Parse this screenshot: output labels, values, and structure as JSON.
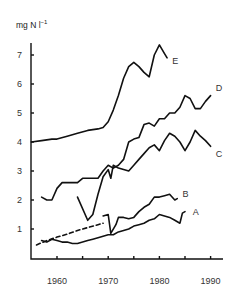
{
  "chart_data": {
    "type": "line",
    "title": "",
    "xlabel": "",
    "ylabel": "mg N l-1",
    "ylabel_unit": {
      "base": "mg N l",
      "superscript": "-1"
    },
    "xlim": [
      1955,
      1992
    ],
    "ylim": [
      0,
      7.5
    ],
    "x_ticks": [
      1960,
      1970,
      1980,
      1990
    ],
    "x_minor_ticks": [
      1965,
      1975,
      1985
    ],
    "y_ticks": [
      1,
      2,
      3,
      4,
      5,
      6,
      7
    ],
    "grid": false,
    "legend": "inline labels at line ends",
    "series": [
      {
        "name": "E",
        "style": "solid",
        "points": [
          [
            1955,
            4.0
          ],
          [
            1957,
            4.05
          ],
          [
            1959,
            4.1
          ],
          [
            1960,
            4.1
          ],
          [
            1962,
            4.2
          ],
          [
            1964,
            4.3
          ],
          [
            1966,
            4.4
          ],
          [
            1968,
            4.45
          ],
          [
            1969,
            4.5
          ],
          [
            1970,
            4.7
          ],
          [
            1971,
            5.1
          ],
          [
            1972,
            5.6
          ],
          [
            1973,
            6.2
          ],
          [
            1974,
            6.6
          ],
          [
            1975,
            6.75
          ],
          [
            1976,
            6.6
          ],
          [
            1977,
            6.4
          ],
          [
            1978,
            6.25
          ],
          [
            1979,
            7.0
          ],
          [
            1980,
            7.35
          ],
          [
            1981,
            7.05
          ],
          [
            1981.5,
            6.9
          ]
        ]
      },
      {
        "name": "D",
        "style": "solid",
        "points": [
          [
            1957,
            2.1
          ],
          [
            1958,
            2.0
          ],
          [
            1959,
            2.0
          ],
          [
            1960,
            2.4
          ],
          [
            1961,
            2.6
          ],
          [
            1962,
            2.6
          ],
          [
            1963,
            2.6
          ],
          [
            1964,
            2.6
          ],
          [
            1965,
            2.75
          ],
          [
            1966,
            2.75
          ],
          [
            1967,
            2.75
          ],
          [
            1968,
            2.75
          ],
          [
            1969,
            3.0
          ],
          [
            1970,
            3.2
          ],
          [
            1971,
            3.1
          ],
          [
            1972,
            3.2
          ],
          [
            1973,
            3.4
          ],
          [
            1974,
            4.0
          ],
          [
            1975,
            4.1
          ],
          [
            1976,
            4.15
          ],
          [
            1977,
            4.6
          ],
          [
            1978,
            4.65
          ],
          [
            1979,
            4.55
          ],
          [
            1980,
            4.8
          ],
          [
            1981,
            4.8
          ],
          [
            1982,
            5.0
          ],
          [
            1983,
            5.0
          ],
          [
            1984,
            5.2
          ],
          [
            1985,
            5.6
          ],
          [
            1986,
            5.5
          ],
          [
            1987,
            5.15
          ],
          [
            1988,
            5.15
          ],
          [
            1989,
            5.4
          ],
          [
            1990,
            5.6
          ]
        ]
      },
      {
        "name": "C",
        "style": "solid",
        "points": [
          [
            1964,
            2.1
          ],
          [
            1966,
            1.3
          ],
          [
            1967,
            1.5
          ],
          [
            1968,
            2.2
          ],
          [
            1969,
            2.8
          ],
          [
            1970,
            3.05
          ],
          [
            1970.5,
            2.75
          ],
          [
            1971,
            3.2
          ],
          [
            1972,
            3.1
          ],
          [
            1973,
            3.05
          ],
          [
            1974,
            3.0
          ],
          [
            1975,
            3.2
          ],
          [
            1976,
            3.4
          ],
          [
            1977,
            3.6
          ],
          [
            1978,
            3.8
          ],
          [
            1979,
            3.9
          ],
          [
            1980,
            3.7
          ],
          [
            1981,
            4.05
          ],
          [
            1982,
            4.3
          ],
          [
            1983,
            4.2
          ],
          [
            1984,
            4.0
          ],
          [
            1985,
            3.7
          ],
          [
            1986,
            4.0
          ],
          [
            1987,
            4.4
          ],
          [
            1988,
            4.2
          ],
          [
            1989,
            4.05
          ],
          [
            1990,
            3.85
          ]
        ]
      },
      {
        "name": "B",
        "style": "dashed-then-solid",
        "dashed_points": [
          [
            1956,
            0.45
          ],
          [
            1958,
            0.6
          ],
          [
            1960,
            0.72
          ],
          [
            1962,
            0.82
          ],
          [
            1964,
            0.95
          ],
          [
            1966,
            1.05
          ],
          [
            1968,
            1.15
          ],
          [
            1969,
            1.2
          ]
        ],
        "points": [
          [
            1969,
            1.45
          ],
          [
            1970,
            1.5
          ],
          [
            1970.5,
            0.85
          ],
          [
            1971.5,
            1.15
          ],
          [
            1972,
            1.4
          ],
          [
            1973,
            1.4
          ],
          [
            1974,
            1.35
          ],
          [
            1975,
            1.4
          ],
          [
            1976,
            1.6
          ],
          [
            1977,
            1.75
          ],
          [
            1978,
            1.85
          ],
          [
            1979,
            2.1
          ],
          [
            1980,
            2.1
          ],
          [
            1981,
            2.15
          ],
          [
            1982,
            2.2
          ],
          [
            1983,
            2.0
          ],
          [
            1983.5,
            2.05
          ]
        ]
      },
      {
        "name": "A",
        "style": "solid",
        "points": [
          [
            1957,
            0.6
          ],
          [
            1958,
            0.55
          ],
          [
            1959,
            0.65
          ],
          [
            1960,
            0.6
          ],
          [
            1961,
            0.55
          ],
          [
            1962,
            0.55
          ],
          [
            1963,
            0.5
          ],
          [
            1964,
            0.5
          ],
          [
            1965,
            0.55
          ],
          [
            1966,
            0.6
          ],
          [
            1967,
            0.65
          ],
          [
            1968,
            0.7
          ],
          [
            1969,
            0.75
          ],
          [
            1970,
            0.8
          ],
          [
            1971,
            0.8
          ],
          [
            1972,
            0.9
          ],
          [
            1973,
            0.95
          ],
          [
            1974,
            1.0
          ],
          [
            1975,
            1.1
          ],
          [
            1976,
            1.15
          ],
          [
            1977,
            1.2
          ],
          [
            1978,
            1.3
          ],
          [
            1979,
            1.35
          ],
          [
            1980,
            1.5
          ],
          [
            1981,
            1.45
          ],
          [
            1982,
            1.4
          ],
          [
            1983,
            1.3
          ],
          [
            1984,
            1.2
          ],
          [
            1984.5,
            1.55
          ],
          [
            1985,
            1.6
          ]
        ]
      }
    ],
    "labels": [
      {
        "text": "E",
        "year": 1982.5,
        "value": 6.8
      },
      {
        "text": "D",
        "year": 1991,
        "value": 5.85
      },
      {
        "text": "C",
        "year": 1991,
        "value": 3.6
      },
      {
        "text": "B",
        "year": 1984.5,
        "value": 2.2
      },
      {
        "text": "A",
        "year": 1986.5,
        "value": 1.6
      }
    ]
  },
  "axis": {
    "ylabel_base": "mg N l",
    "ylabel_sup": "−1"
  }
}
